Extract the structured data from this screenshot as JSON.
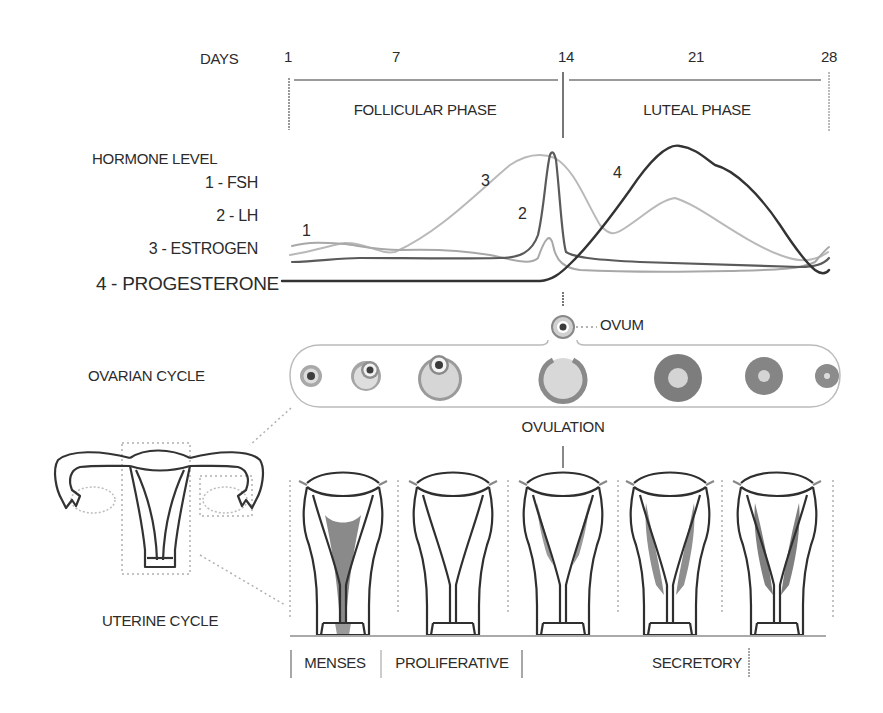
{
  "timeline": {
    "axis_label": "DAYS",
    "ticks": [
      {
        "label": "1",
        "x": 261
      },
      {
        "label": "7",
        "x": 396
      },
      {
        "label": "14",
        "x": 566
      },
      {
        "label": "21",
        "x": 696
      },
      {
        "label": "28",
        "x": 829
      }
    ],
    "phases": [
      {
        "label": "FOLLICULAR PHASE",
        "x": 457
      },
      {
        "label": "LUTEAL PHASE",
        "x": 697
      }
    ]
  },
  "hormones": {
    "title": "HORMONE LEVEL",
    "legend": [
      {
        "id": "1",
        "label": "1 - FSH",
        "color": "#a9a9a9"
      },
      {
        "id": "2",
        "label": "2 - LH",
        "color": "#555555"
      },
      {
        "id": "3",
        "label": "3 - ESTROGEN",
        "color": "#b8b8b8"
      },
      {
        "id": "4",
        "label": "4 - PROGESTERONE",
        "color": "#3a3a3a"
      }
    ],
    "curve_markers": [
      {
        "label": "1",
        "x": 306,
        "y": 220
      },
      {
        "label": "2",
        "x": 522,
        "y": 212
      },
      {
        "label": "3",
        "x": 485,
        "y": 175
      },
      {
        "label": "4",
        "x": 616,
        "y": 172
      }
    ]
  },
  "ovarian_cycle": {
    "label": "OVARIAN CYCLE",
    "ovum_label": "OVUM",
    "ovulation_label": "OVULATION",
    "stages": [
      "primary follicle",
      "secondary follicle",
      "mature follicle",
      "ruptured follicle",
      "corpus luteum",
      "regressing corpus luteum",
      "corpus albicans"
    ]
  },
  "uterine_cycle": {
    "label": "UTERINE CYCLE",
    "phases": [
      {
        "label": "MENSES",
        "x": 335
      },
      {
        "label": "PROLIFERATIVE",
        "x": 452
      },
      {
        "label": "SECRETORY",
        "x": 697
      }
    ]
  }
}
